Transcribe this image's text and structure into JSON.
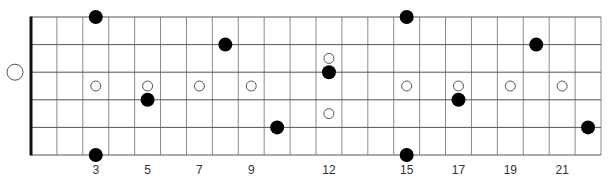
{
  "diagram": {
    "type": "guitar-fretboard",
    "strings": 6,
    "frets": 22,
    "colors": {
      "background": "#ffffff",
      "grid": "#8a8a8a",
      "string": "#555555",
      "nut": "#111111",
      "note": "#000000",
      "inlay_stroke": "#555555"
    },
    "fret_numbers": [
      {
        "fret": 3,
        "label": "3"
      },
      {
        "fret": 5,
        "label": "5"
      },
      {
        "fret": 7,
        "label": "7"
      },
      {
        "fret": 9,
        "label": "9"
      },
      {
        "fret": 12,
        "label": "12"
      },
      {
        "fret": 15,
        "label": "15"
      },
      {
        "fret": 17,
        "label": "17"
      },
      {
        "fret": 19,
        "label": "19"
      },
      {
        "fret": 21,
        "label": "21"
      }
    ],
    "inlays": [
      {
        "fret": 3,
        "position": "center"
      },
      {
        "fret": 5,
        "position": "center"
      },
      {
        "fret": 7,
        "position": "center"
      },
      {
        "fret": 9,
        "position": "center"
      },
      {
        "fret": 12,
        "position": "upper"
      },
      {
        "fret": 12,
        "position": "lower"
      },
      {
        "fret": 15,
        "position": "center"
      },
      {
        "fret": 17,
        "position": "center"
      },
      {
        "fret": 19,
        "position": "center"
      },
      {
        "fret": 21,
        "position": "center"
      }
    ],
    "open_strings": [
      {
        "string": 3,
        "marker": "open-circle"
      }
    ],
    "notes": [
      {
        "string": 1,
        "fret": 3
      },
      {
        "string": 6,
        "fret": 3
      },
      {
        "string": 4,
        "fret": 5
      },
      {
        "string": 2,
        "fret": 8
      },
      {
        "string": 5,
        "fret": 10
      },
      {
        "string": 3,
        "fret": 12
      },
      {
        "string": 1,
        "fret": 15
      },
      {
        "string": 6,
        "fret": 15
      },
      {
        "string": 4,
        "fret": 17
      },
      {
        "string": 2,
        "fret": 20
      },
      {
        "string": 5,
        "fret": 22
      }
    ]
  }
}
